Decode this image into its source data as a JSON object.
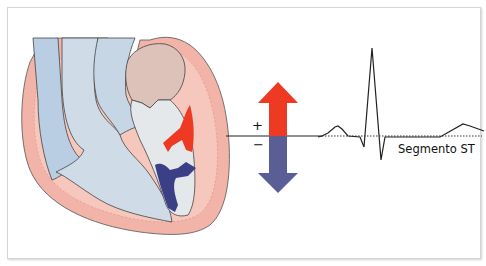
{
  "diagram": {
    "labels": {
      "plus": "+",
      "minus": "−",
      "st_segment": "Segmento ST"
    },
    "colors": {
      "frame_border": "#d6d6d6",
      "myocardium_pink": "#f2b3a8",
      "myocardium_dark": "#e9998c",
      "vessel_blue": "#b9cde3",
      "vessel_blue_light": "#cfdbe6",
      "chamber_grey": "#e4e8ea",
      "atrium_tan": "#dcc2b8",
      "positive_arrow_red": "#ee3a22",
      "negative_arrow_blue": "#5b5d95",
      "injury_current_dark_blue": "#3a3f86",
      "ecg_line": "#222222"
    },
    "vector_arrow": {
      "up_label": "+",
      "down_label": "−"
    },
    "ecg": {
      "baseline_style": "dotted",
      "waves": [
        "P",
        "QRS",
        "T"
      ],
      "annotation": "Segmento ST"
    }
  }
}
